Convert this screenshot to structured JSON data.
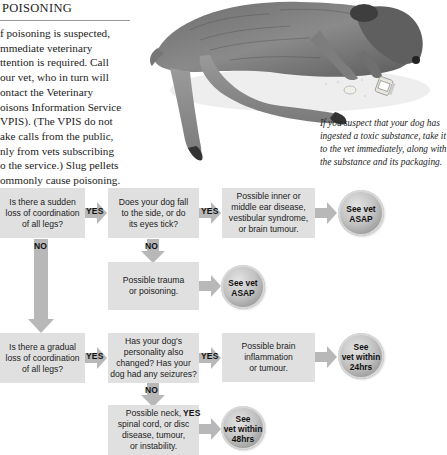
{
  "section": {
    "title": "POISONING",
    "intro_lines": [
      "f poisoning is suspected,",
      "mmediate veterinary",
      "ttention is required. Call",
      "our vet, who in turn will",
      "ontact the Veterinary",
      "oisons Information Service",
      "VPIS). (The VPIS do not",
      "ake calls from the public,",
      "nly from vets subscribing",
      "o the service.) Slug pellets",
      "ommonly cause poisoning."
    ]
  },
  "illustration": {
    "subject": "dog-lying-poisoned-with-pills",
    "caption_lines": [
      "If you suspect that your dog has",
      "ingested a toxic substance, take it",
      "to the vet immediately, along with",
      "the substance and its packaging."
    ]
  },
  "flowchart": {
    "labels": {
      "yes": "YES",
      "no": "NO"
    },
    "row1": {
      "q1": [
        "Is there a sudden",
        "loss of coordination",
        "of all legs?"
      ],
      "q2": [
        "Does your dog fall",
        "to the side, or do",
        "its eyes tick?"
      ],
      "result": [
        "Possible inner or",
        "middle ear disease,",
        "vestibular syndrome,",
        "or brain tumour."
      ],
      "action": [
        "See vet",
        "ASAP"
      ],
      "alt_result": [
        "Possible trauma",
        "or poisoning."
      ],
      "alt_action": [
        "See vet",
        "ASAP"
      ]
    },
    "row2": {
      "q1": [
        "Is there a gradual",
        "loss of coordination",
        "of all legs?"
      ],
      "q2": [
        "Has your dog's",
        "personality also",
        "changed? Has your",
        "dog had any seizures?"
      ],
      "result": [
        "Possible brain",
        "inflammation",
        "or tumour."
      ],
      "action": [
        "See",
        "vet within",
        "24hrs"
      ],
      "alt_result": [
        "Possible neck,",
        "spinal cord, or disc",
        "disease, tumour,",
        "or instability."
      ],
      "alt_action": [
        "See",
        "vet within",
        "48hrs"
      ]
    },
    "colors": {
      "box": "#e0e0e0",
      "arrow": "#b8b8b8",
      "circle": "#a8a8a8"
    }
  }
}
